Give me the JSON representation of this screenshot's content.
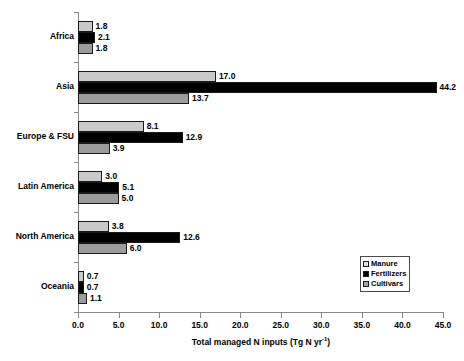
{
  "chart_data": {
    "type": "bar",
    "orientation": "horizontal",
    "title": "",
    "xlabel": "Total managed N inputs (Tg N yr-1)",
    "xlabel_prefix": "Total managed N inputs (Tg N yr",
    "xlabel_superscript": "-1",
    "xlabel_suffix": ")",
    "ylabel": "",
    "categories": [
      "Africa",
      "Asia",
      "Europe & FSU",
      "Latin America",
      "North America",
      "Oceania"
    ],
    "series": [
      {
        "name": "Manure",
        "color": "#c9c9c9",
        "values": [
          1.8,
          17.0,
          8.1,
          3.0,
          3.8,
          0.7
        ],
        "labels": [
          "1.8",
          "17.0",
          "8.1",
          "3.0",
          "3.8",
          "0.7"
        ]
      },
      {
        "name": "Fertilizers",
        "color": "#000000",
        "values": [
          2.1,
          44.2,
          12.9,
          5.1,
          12.6,
          0.7
        ],
        "labels": [
          "2.1",
          "44.2",
          "12.9",
          "5.1",
          "12.6",
          "0.7"
        ]
      },
      {
        "name": "Cultivars",
        "color": "#9c9c9c",
        "values": [
          1.8,
          13.7,
          3.9,
          5.0,
          6.0,
          1.1
        ],
        "labels": [
          "1.8",
          "13.7",
          "3.9",
          "5.0",
          "6.0",
          "1.1"
        ]
      }
    ],
    "xlim": [
      0.0,
      45.0
    ],
    "xticks": [
      0.0,
      5.0,
      10.0,
      15.0,
      20.0,
      25.0,
      30.0,
      35.0,
      40.0,
      45.0
    ],
    "xtick_labels": [
      "0.0",
      "5.0",
      "10.0",
      "15.0",
      "20.0",
      "25.0",
      "30.0",
      "35.0",
      "40.0",
      "45.0"
    ],
    "grid": false,
    "legend_position": "lower-right",
    "legend_entries": [
      "Manure",
      "Fertilizers",
      "Cultivars"
    ]
  }
}
